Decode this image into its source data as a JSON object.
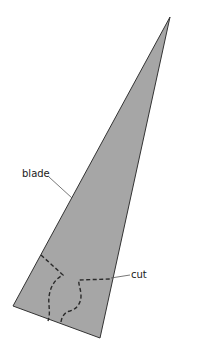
{
  "diagram": {
    "labels": {
      "blade": "blade",
      "cut": "cut"
    },
    "colors": {
      "blade_fill": "#a6a6a6",
      "outline": "#333333",
      "leader": "#555555",
      "background": "#ffffff"
    },
    "shape": {
      "blade_polygon": [
        [
          170,
          17
        ],
        [
          13,
          306
        ],
        [
          100,
          338
        ]
      ]
    }
  }
}
